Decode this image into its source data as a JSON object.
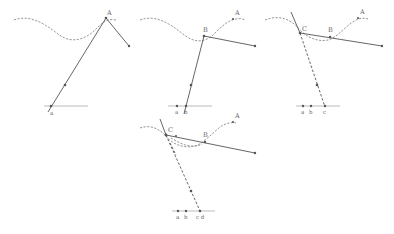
{
  "figure": {
    "panels": [
      {
        "id": "panel-1",
        "labels": {
          "curve_point": "A",
          "base_point": "a"
        }
      },
      {
        "id": "panel-2",
        "labels": {
          "curve_top": "A",
          "curve_point": "B",
          "base_left": "a",
          "base_point": "b"
        }
      },
      {
        "id": "panel-3",
        "labels": {
          "curve_top": "A",
          "curve_mid": "B",
          "curve_point": "C",
          "base_left": "a",
          "base_mid": "b",
          "base_point": "c"
        }
      },
      {
        "id": "panel-4",
        "labels": {
          "curve_top": "A",
          "curve_mid": "B",
          "curve_point": "C",
          "base_left": "a",
          "base_mid": "b",
          "base_point": "c d"
        }
      }
    ]
  }
}
